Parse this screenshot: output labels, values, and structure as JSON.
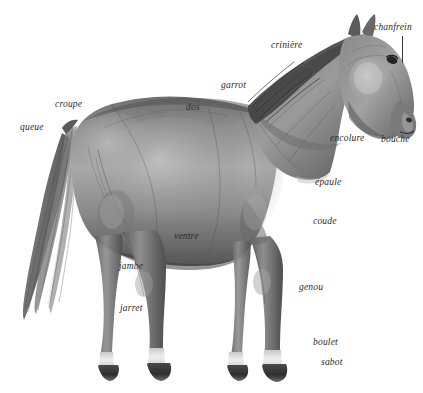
{
  "figure": {
    "background_color": "#ffffff",
    "text_color": "#2b2b2b",
    "width": 423,
    "height": 393
  },
  "labels": [
    {
      "id": "chanfrein",
      "text": "chanfrein",
      "x": 374,
      "y": 23
    },
    {
      "id": "criniere",
      "text": "crinière",
      "x": 271,
      "y": 41
    },
    {
      "id": "garrot",
      "text": "garrot",
      "x": 221,
      "y": 81
    },
    {
      "id": "croupe",
      "text": "croupe",
      "x": 55,
      "y": 100
    },
    {
      "id": "dos",
      "text": "dos",
      "x": 186,
      "y": 103
    },
    {
      "id": "queue",
      "text": "queue",
      "x": 20,
      "y": 123
    },
    {
      "id": "encolure",
      "text": "encolure",
      "x": 330,
      "y": 134
    },
    {
      "id": "bouche",
      "text": "bouche",
      "x": 381,
      "y": 135
    },
    {
      "id": "epaule",
      "text": "épaule",
      "x": 315,
      "y": 178
    },
    {
      "id": "coude",
      "text": "coude",
      "x": 313,
      "y": 217
    },
    {
      "id": "ventre",
      "text": "ventre",
      "x": 174,
      "y": 232
    },
    {
      "id": "jambe",
      "text": "jambe",
      "x": 119,
      "y": 262
    },
    {
      "id": "genou",
      "text": "genou",
      "x": 299,
      "y": 283
    },
    {
      "id": "jarret",
      "text": "jarret",
      "x": 120,
      "y": 304
    },
    {
      "id": "boulet",
      "text": "boulet",
      "x": 313,
      "y": 338
    },
    {
      "id": "sabot",
      "text": "sabot",
      "x": 321,
      "y": 358
    }
  ],
  "leader_lines": [
    {
      "id": "chanfrein-leader",
      "x": 402,
      "y": 36,
      "width": 1,
      "height": 27
    }
  ]
}
